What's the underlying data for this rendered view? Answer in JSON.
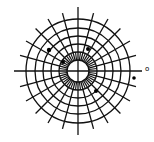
{
  "diagram": {
    "type": "polar-grid",
    "center": [
      78,
      71
    ],
    "ring_radii": [
      11,
      19,
      27,
      35,
      43,
      52
    ],
    "spoke_count": 24,
    "spoke_inner_radius": 11,
    "spoke_outer_radius": 60,
    "axis_extent": 64,
    "stroke_color": "#111111",
    "background": "#ffffff",
    "markers": [
      {
        "x": 49,
        "y": 50,
        "r": 2.2
      },
      {
        "x": 63,
        "y": 62,
        "r": 2.0
      },
      {
        "x": 88,
        "y": 49,
        "r": 2.0
      },
      {
        "x": 96,
        "y": 91,
        "r": 2.0
      },
      {
        "x": 134,
        "y": 78,
        "r": 1.8
      }
    ],
    "labels": [
      {
        "text": "o",
        "x": 145,
        "y": 66
      }
    ]
  }
}
